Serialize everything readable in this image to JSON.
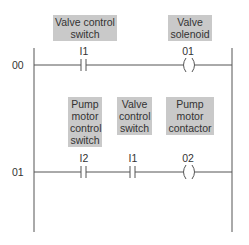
{
  "diagram": {
    "type": "ladder-logic",
    "rungs": [
      {
        "number": "00",
        "elements": [
          {
            "kind": "contact-no",
            "address": "I1",
            "label": "Valve control switch"
          },
          {
            "kind": "coil",
            "address": "01",
            "label": "Valve solenoid"
          }
        ]
      },
      {
        "number": "01",
        "elements": [
          {
            "kind": "contact-no",
            "address": "I2",
            "label": "Pump motor control switch"
          },
          {
            "kind": "contact-no",
            "address": "I1",
            "label": "Valve control switch"
          },
          {
            "kind": "coil",
            "address": "02",
            "label": "Pump motor contactor"
          }
        ]
      }
    ]
  },
  "labels": {
    "r0_contact_line1": "Valve control",
    "r0_contact_line2": "switch",
    "r0_coil_line1": "Valve",
    "r0_coil_line2": "solenoid",
    "r1_c1_line1": "Pump",
    "r1_c1_line2": "motor",
    "r1_c1_line3": "control",
    "r1_c1_line4": "switch",
    "r1_c2_line1": "Valve",
    "r1_c2_line2": "control",
    "r1_c2_line3": "switch",
    "r1_coil_line1": "Pump",
    "r1_coil_line2": "motor",
    "r1_coil_line3": "contactor"
  },
  "colors": {
    "label_bg": "#c9c9c9",
    "line": "#555555"
  }
}
